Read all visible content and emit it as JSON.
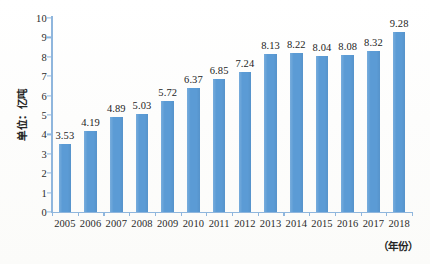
{
  "chart_data": {
    "type": "bar",
    "title": "",
    "subtitle": "",
    "xlabel": "（年份）",
    "ylabel": "单位：亿吨",
    "ylim": [
      0,
      10
    ],
    "ytick_step": 1,
    "yticks": [
      "0",
      "1",
      "2",
      "3",
      "4",
      "5",
      "6",
      "7",
      "8",
      "9",
      "10"
    ],
    "grid": false,
    "legend": null,
    "legend_position": "none",
    "categories": [
      "2005",
      "2006",
      "2007",
      "2008",
      "2009",
      "2010",
      "2011",
      "2012",
      "2013",
      "2014",
      "2015",
      "2016",
      "2017",
      "2018"
    ],
    "values": [
      3.53,
      4.19,
      4.89,
      5.03,
      5.72,
      6.37,
      6.85,
      7.24,
      8.13,
      8.22,
      8.04,
      8.08,
      8.32,
      9.28
    ],
    "data_labels": [
      "3.53",
      "4.19",
      "4.89",
      "5.03",
      "5.72",
      "6.37",
      "6.85",
      "7.24",
      "8.13",
      "8.22",
      "8.04",
      "8.08",
      "8.32",
      "9.28"
    ],
    "bar_color": "#5b9bd5",
    "axis_color": "#8fb6dd",
    "text_color": "#262626",
    "background_color": "#fdfdfb"
  }
}
